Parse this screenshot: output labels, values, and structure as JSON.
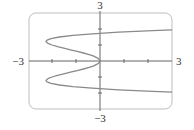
{
  "chart_data": {
    "type": "line",
    "title": "",
    "xlabel": "",
    "ylabel": "",
    "equation": "x = y^4 - 3y^2",
    "xlim": [
      -3,
      3
    ],
    "ylim": [
      -3,
      3
    ],
    "grid": false,
    "legend": null,
    "x_tick_step": 1,
    "y_tick_step": 1,
    "tick_labels": {
      "x_min": "−3",
      "x_max": "3",
      "y_min": "−3",
      "y_max": "3"
    },
    "series": [
      {
        "name": "x = y^4 - 3y^2",
        "points": [
          {
            "x": 3.0,
            "y": 1.95
          },
          {
            "x": 2.2,
            "y": 1.9
          },
          {
            "x": 0.78,
            "y": 1.8
          },
          {
            "x": -0.32,
            "y": 1.7
          },
          {
            "x": -1.13,
            "y": 1.6
          },
          {
            "x": -1.69,
            "y": 1.5
          },
          {
            "x": -2.04,
            "y": 1.4
          },
          {
            "x": -2.21,
            "y": 1.3
          },
          {
            "x": -2.25,
            "y": 1.22
          },
          {
            "x": -2.17,
            "y": 1.1
          },
          {
            "x": -2.0,
            "y": 1.0
          },
          {
            "x": -1.77,
            "y": 0.9
          },
          {
            "x": -1.51,
            "y": 0.8
          },
          {
            "x": -1.23,
            "y": 0.7
          },
          {
            "x": -0.95,
            "y": 0.6
          },
          {
            "x": -0.69,
            "y": 0.5
          },
          {
            "x": -0.45,
            "y": 0.4
          },
          {
            "x": -0.26,
            "y": 0.3
          },
          {
            "x": -0.12,
            "y": 0.2
          },
          {
            "x": -0.03,
            "y": 0.1
          },
          {
            "x": 0.0,
            "y": 0.0
          },
          {
            "x": -0.03,
            "y": -0.1
          },
          {
            "x": -0.12,
            "y": -0.2
          },
          {
            "x": -0.26,
            "y": -0.3
          },
          {
            "x": -0.45,
            "y": -0.4
          },
          {
            "x": -0.69,
            "y": -0.5
          },
          {
            "x": -0.95,
            "y": -0.6
          },
          {
            "x": -1.23,
            "y": -0.7
          },
          {
            "x": -1.51,
            "y": -0.8
          },
          {
            "x": -1.77,
            "y": -0.9
          },
          {
            "x": -2.0,
            "y": -1.0
          },
          {
            "x": -2.17,
            "y": -1.1
          },
          {
            "x": -2.25,
            "y": -1.22
          },
          {
            "x": -2.21,
            "y": -1.3
          },
          {
            "x": -2.04,
            "y": -1.4
          },
          {
            "x": -1.69,
            "y": -1.5
          },
          {
            "x": -1.13,
            "y": -1.6
          },
          {
            "x": -0.32,
            "y": -1.7
          },
          {
            "x": 0.78,
            "y": -1.8
          },
          {
            "x": 2.2,
            "y": -1.9
          },
          {
            "x": 3.0,
            "y": -1.95
          }
        ]
      }
    ]
  },
  "style": {
    "curve_color": "#8a8a8a",
    "axis_color": "#666666",
    "frame_color": "#bdbdbd",
    "label_color": "#333333"
  }
}
